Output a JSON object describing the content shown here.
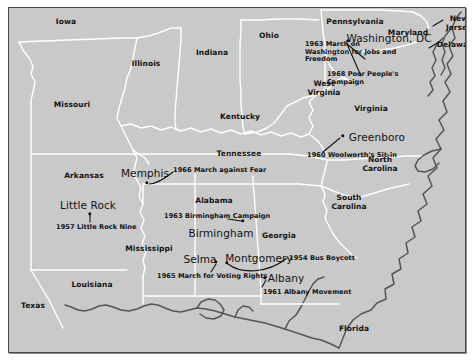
{
  "map": {
    "title": "Civil Rights Movement Events Map",
    "background_color": "#c9c9c9",
    "border_color": "#4a4a4a",
    "state_border_color": "#ffffff",
    "coastline_color": "#555555",
    "label_color": "#111111"
  },
  "states": [
    {
      "name": "Iowa",
      "x": 57,
      "y": 13
    },
    {
      "name": "Illinois",
      "x": 137,
      "y": 55
    },
    {
      "name": "Indiana",
      "x": 203,
      "y": 44
    },
    {
      "name": "Ohio",
      "x": 260,
      "y": 27
    },
    {
      "name": "Pennsylvania",
      "x": 346,
      "y": 13
    },
    {
      "name": "Maryland",
      "x": 399,
      "y": 24
    },
    {
      "name": "New Jersey",
      "x": 450,
      "y": 15
    },
    {
      "name": "Delaware",
      "x": 448,
      "y": 36
    },
    {
      "name": "Missouri",
      "x": 63,
      "y": 96
    },
    {
      "name": "Kentucky",
      "x": 231,
      "y": 108
    },
    {
      "name": "West Virginia",
      "x": 315,
      "y": 80
    },
    {
      "name": "Virginia",
      "x": 362,
      "y": 100
    },
    {
      "name": "Tennessee",
      "x": 230,
      "y": 145
    },
    {
      "name": "North Carolina",
      "x": 371,
      "y": 156
    },
    {
      "name": "Arkansas",
      "x": 75,
      "y": 167
    },
    {
      "name": "Alabama",
      "x": 205,
      "y": 192
    },
    {
      "name": "South Carolina",
      "x": 340,
      "y": 194
    },
    {
      "name": "Mississippi",
      "x": 140,
      "y": 240
    },
    {
      "name": "Georgia",
      "x": 270,
      "y": 227
    },
    {
      "name": "Louisiana",
      "x": 83,
      "y": 276
    },
    {
      "name": "Texas",
      "x": 24,
      "y": 297
    },
    {
      "name": "Florida",
      "x": 345,
      "y": 320
    }
  ],
  "cities": [
    {
      "name": "Washington, DC",
      "label_x": 380,
      "label_y": 30,
      "dot_x": 339,
      "dot_y": 33
    },
    {
      "name": "Greenboro",
      "label_x": 368,
      "label_y": 129,
      "dot_x": 334,
      "dot_y": 128
    },
    {
      "name": "Memphis",
      "label_x": 136,
      "label_y": 165,
      "dot_x": 138,
      "dot_y": 175
    },
    {
      "name": "Little Rock",
      "label_x": 79,
      "label_y": 197,
      "dot_x": 81,
      "dot_y": 206
    },
    {
      "name": "Birmingham",
      "label_x": 212,
      "label_y": 225,
      "dot_x": 234,
      "dot_y": 213
    },
    {
      "name": "Selma",
      "label_x": 191,
      "label_y": 251,
      "dot_x": 207,
      "dot_y": 254
    },
    {
      "name": "Montgomery",
      "label_x": 250,
      "label_y": 250,
      "dot_x": 218,
      "dot_y": 255
    },
    {
      "name": "Albany",
      "label_x": 277,
      "label_y": 270,
      "dot_x": 256,
      "dot_y": 270
    }
  ],
  "events": [
    {
      "text": "1963 March on Washington for Jobs and Freedom",
      "x": 296,
      "y": 44,
      "align": "left",
      "multiline": true
    },
    {
      "text": "1968 Poor People's Campaign",
      "x": 318,
      "y": 71,
      "align": "left",
      "multiline": true
    },
    {
      "text": "1960 Woolworth's Sit-in",
      "x": 298,
      "y": 147,
      "align": "left",
      "multiline": false
    },
    {
      "text": "1966 March against Fear",
      "x": 164,
      "y": 162,
      "align": "left",
      "multiline": false
    },
    {
      "text": "1957 Little Rock Nine",
      "x": 47,
      "y": 219,
      "align": "left",
      "multiline": false
    },
    {
      "text": "1963 Birmingham Campaign",
      "x": 155,
      "y": 208,
      "align": "left",
      "multiline": false
    },
    {
      "text": "1954 Bus Boycott",
      "x": 280,
      "y": 250,
      "align": "left",
      "multiline": false
    },
    {
      "text": "1965 March for Voting Rights",
      "x": 148,
      "y": 268,
      "align": "left",
      "multiline": false
    },
    {
      "text": "1961 Albany Movement",
      "x": 254,
      "y": 284,
      "align": "left",
      "multiline": false
    }
  ]
}
